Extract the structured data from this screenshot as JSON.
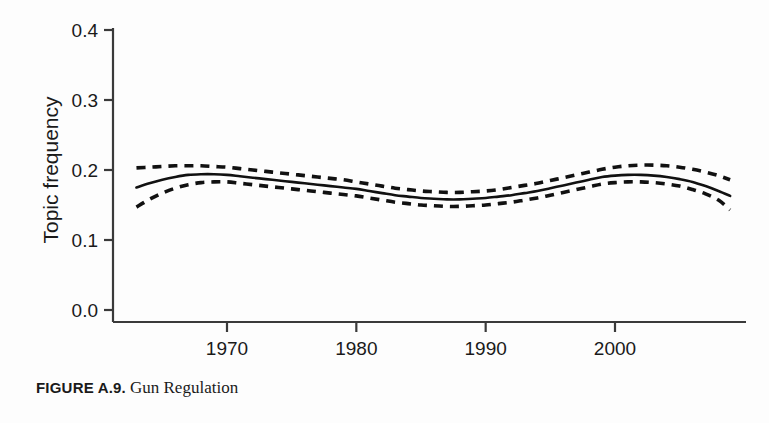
{
  "caption": {
    "figure_number": "FIGURE A.9.",
    "title": "Gun Regulation"
  },
  "chart_data": {
    "type": "line",
    "title": "",
    "xlabel": "",
    "ylabel": "Topic frequency",
    "xlim": [
      1961.5,
      2010.5
    ],
    "ylim": [
      0.0,
      0.42
    ],
    "grid": false,
    "legend": null,
    "x_ticks": [
      1970,
      1980,
      1990,
      2000
    ],
    "x_tick_labels": [
      "1970",
      "1980",
      "1990",
      "2000"
    ],
    "y_ticks": [
      0.0,
      0.1,
      0.2,
      0.3,
      0.4
    ],
    "y_tick_labels": [
      "0.0",
      "0.1",
      "0.2",
      "0.3",
      "0.4"
    ],
    "x": [
      1963.0,
      1964.0,
      1965.0,
      1966.0,
      1967.0,
      1968.0,
      1969.0,
      1970.0,
      1971.0,
      1972.0,
      1973.0,
      1974.0,
      1975.0,
      1976.0,
      1977.0,
      1978.0,
      1979.0,
      1980.0,
      1981.0,
      1982.0,
      1983.0,
      1984.0,
      1985.0,
      1986.0,
      1987.0,
      1988.0,
      1989.0,
      1990.0,
      1991.0,
      1992.0,
      1993.0,
      1994.0,
      1995.0,
      1996.0,
      1997.0,
      1998.0,
      1999.0,
      2000.0,
      2001.0,
      2002.0,
      2003.0,
      2004.0,
      2005.0,
      2006.0,
      2007.0,
      2008.0,
      2008.9
    ],
    "series": [
      {
        "name": "estimate",
        "style": "solid",
        "values": [
          0.175,
          0.181,
          0.186,
          0.19,
          0.193,
          0.194,
          0.194,
          0.193,
          0.191,
          0.189,
          0.187,
          0.185,
          0.183,
          0.181,
          0.179,
          0.177,
          0.175,
          0.173,
          0.17,
          0.167,
          0.164,
          0.162,
          0.16,
          0.159,
          0.158,
          0.158,
          0.159,
          0.16,
          0.162,
          0.164,
          0.167,
          0.17,
          0.174,
          0.178,
          0.182,
          0.186,
          0.19,
          0.192,
          0.193,
          0.193,
          0.192,
          0.19,
          0.187,
          0.183,
          0.177,
          0.17,
          0.163
        ]
      },
      {
        "name": "upper confidence bound",
        "style": "dashed",
        "values": [
          0.203,
          0.204,
          0.205,
          0.206,
          0.206,
          0.206,
          0.205,
          0.204,
          0.202,
          0.2,
          0.198,
          0.196,
          0.194,
          0.192,
          0.19,
          0.188,
          0.186,
          0.183,
          0.18,
          0.177,
          0.174,
          0.172,
          0.17,
          0.169,
          0.168,
          0.168,
          0.169,
          0.17,
          0.172,
          0.175,
          0.178,
          0.181,
          0.185,
          0.189,
          0.193,
          0.197,
          0.201,
          0.204,
          0.206,
          0.207,
          0.207,
          0.206,
          0.204,
          0.201,
          0.197,
          0.192,
          0.186
        ]
      },
      {
        "name": "lower confidence bound",
        "style": "dashed",
        "values": [
          0.147,
          0.158,
          0.167,
          0.174,
          0.179,
          0.182,
          0.183,
          0.183,
          0.181,
          0.179,
          0.177,
          0.175,
          0.173,
          0.171,
          0.169,
          0.167,
          0.165,
          0.163,
          0.16,
          0.157,
          0.154,
          0.152,
          0.15,
          0.149,
          0.148,
          0.148,
          0.149,
          0.15,
          0.152,
          0.154,
          0.157,
          0.16,
          0.164,
          0.168,
          0.172,
          0.176,
          0.18,
          0.182,
          0.183,
          0.183,
          0.182,
          0.18,
          0.177,
          0.172,
          0.166,
          0.157,
          0.143
        ]
      }
    ],
    "colors": {
      "line": "#111111",
      "background": "#fdfdfd",
      "axis": "#3a3a3a"
    }
  }
}
